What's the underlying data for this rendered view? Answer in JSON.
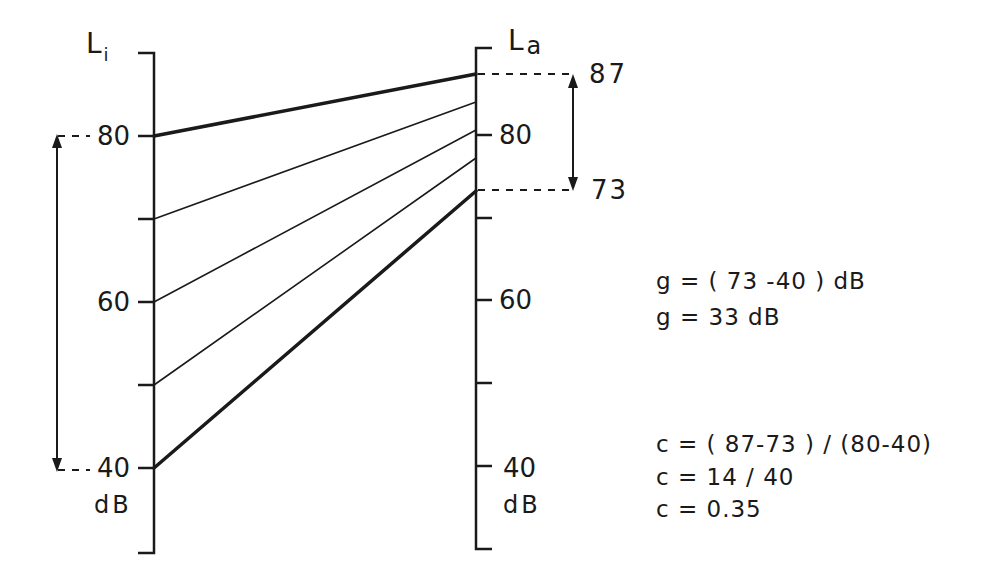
{
  "diagram": {
    "left_axis": {
      "title": "L",
      "subscript": "i",
      "unit": "dB",
      "ticks": [
        {
          "value": 80,
          "label": "80"
        },
        {
          "value": 70,
          "label": ""
        },
        {
          "value": 60,
          "label": "60"
        },
        {
          "value": 50,
          "label": ""
        },
        {
          "value": 40,
          "label": "40"
        }
      ]
    },
    "right_axis": {
      "title": "L",
      "subscript": "a",
      "unit": "dB",
      "ticks": [
        {
          "value": 80,
          "label": "80"
        },
        {
          "value": 70,
          "label": ""
        },
        {
          "value": 60,
          "label": "60"
        },
        {
          "value": 50,
          "label": ""
        },
        {
          "value": 40,
          "label": "40"
        }
      ],
      "marked_values": [
        {
          "value": 87,
          "label": "87"
        },
        {
          "value": 73,
          "label": "73"
        }
      ]
    },
    "mapping_lines": [
      {
        "input": 80,
        "output": 87,
        "weight": "thick"
      },
      {
        "input": 70,
        "output": 83.5,
        "weight": "thin"
      },
      {
        "input": 60,
        "output": 80,
        "weight": "thin"
      },
      {
        "input": 50,
        "output": 76.5,
        "weight": "thin"
      },
      {
        "input": 40,
        "output": 73,
        "weight": "thick"
      }
    ],
    "input_range_arrow": {
      "from": 40,
      "to": 80
    },
    "output_range_arrow": {
      "from": 73,
      "to": 87
    },
    "equations": {
      "g_line1": "g = ( 73 -40 )   dB",
      "g_line2": "g =  33 dB",
      "c_line1": "c  = ( 87-73 ) / (80-40)",
      "c_line2": "c  =  14  / 40",
      "c_line3": "c  =  0.35"
    }
  }
}
